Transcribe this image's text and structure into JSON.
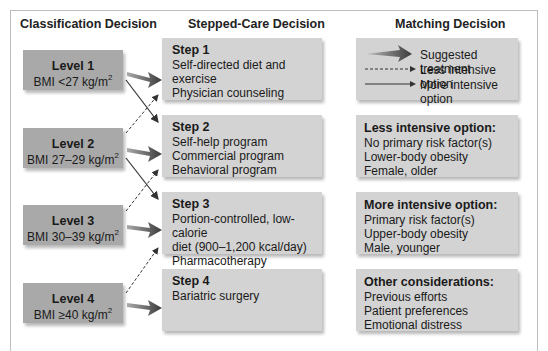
{
  "columns": {
    "classification": "Classification Decision",
    "stepped_care": "Stepped-Care Decision",
    "matching": "Matching Decision"
  },
  "levels": [
    {
      "title": "Level 1",
      "bmi_prefix": "BMI <27 kg/m",
      "sup": "2"
    },
    {
      "title": "Level 2",
      "bmi_prefix": "BMI 27–29 kg/m",
      "sup": "2"
    },
    {
      "title": "Level 3",
      "bmi_prefix": "BMI 30–39 kg/m",
      "sup": "2"
    },
    {
      "title": "Level 4",
      "bmi_prefix": "BMI ≥40 kg/m",
      "sup": "2"
    }
  ],
  "steps": [
    {
      "title": "Step 1",
      "lines": [
        "Self-directed diet and exercise",
        "Physician counseling",
        ""
      ]
    },
    {
      "title": "Step 2",
      "lines": [
        "Self-help program",
        "Commercial program",
        "Behavioral program"
      ]
    },
    {
      "title": "Step 3",
      "lines": [
        "Portion-controlled, low-calorie",
        "diet (900–1,200 kcal/day)",
        "Pharmacotherapy"
      ]
    },
    {
      "title": "Step 4",
      "lines": [
        "Bariatric surgery",
        "",
        ""
      ]
    }
  ],
  "legend": {
    "suggested": "Suggested treatment",
    "less": "Less intensive option",
    "more": "More intensive option"
  },
  "matching": [
    {
      "title": "Less intensive option:",
      "lines": [
        "No primary risk factor(s)",
        "Lower-body obesity",
        "Female, older"
      ]
    },
    {
      "title": "More intensive option:",
      "lines": [
        "Primary risk factor(s)",
        "Upper-body obesity",
        "Male, younger"
      ]
    },
    {
      "title": "Other considerations:",
      "lines": [
        "Previous efforts",
        "Patient preferences",
        "Emotional distress"
      ]
    }
  ],
  "colors": {
    "level_box": "#a9a9a9",
    "step_box": "#d3d3d3",
    "arrow": "#444444"
  }
}
